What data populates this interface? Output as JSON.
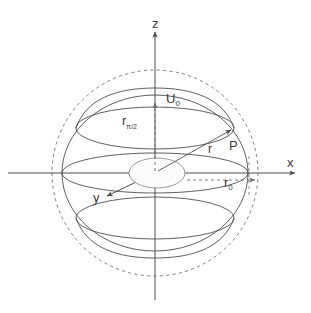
{
  "figure": {
    "background_color": "#ffffff",
    "stroke_color": "#4d4d4d",
    "dashed_stroke_color": "#6e6e6e",
    "label_color": "#3a3a3a"
  },
  "axes": [
    {
      "id": "z",
      "label": "z",
      "direction": "up",
      "arrow": true
    },
    {
      "id": "x",
      "label": "x",
      "direction": "right",
      "arrow": true
    },
    {
      "id": "y",
      "label": "y",
      "direction": "down-left",
      "arrow": true
    }
  ],
  "labels": {
    "z_axis": "z",
    "x_axis": "x",
    "y_axis": "y",
    "potential_surface": "U",
    "potential_surface_subscript": "0",
    "equatorial_radius": "r",
    "equatorial_radius_subscript": "π/2",
    "position_vector": "r",
    "point": "P",
    "reference_radius": "r",
    "reference_radius_subscript": "0"
  },
  "geometry": {
    "origin": {
      "x": 155,
      "y": 173
    },
    "reference_sphere": {
      "name": "dashed reference circle",
      "radius": 103,
      "style": "dashed",
      "label": "r0"
    },
    "equipotential_surface": {
      "name": "oblate spheroid U0",
      "semi_axis_x": 93,
      "semi_axis_z": 78,
      "style": "solid"
    },
    "equatorial_ring": {
      "name": "r_pi/2 equatorial ellipse ring",
      "semi_axis_x": 93,
      "semi_axis_y": 20,
      "center_y": 130,
      "style": "solid"
    },
    "center_disk": {
      "name": "central ellipse at origin",
      "semi_axis_x": 28,
      "semi_axis_y": 15,
      "style": "solid"
    },
    "position_vector": {
      "from": {
        "x": 155,
        "y": 173
      },
      "to": {
        "x": 228,
        "y": 131
      },
      "arrow": true
    },
    "r0_measure": {
      "from": {
        "x": 186,
        "y": 180
      },
      "to": {
        "x": 262,
        "y": 180
      },
      "style": "dashed",
      "arrow": true
    },
    "z_measure": {
      "from": {
        "x": 155,
        "y": 173
      },
      "to": {
        "x": 155,
        "y": 100
      },
      "style": "dashed",
      "arrow": true
    }
  }
}
